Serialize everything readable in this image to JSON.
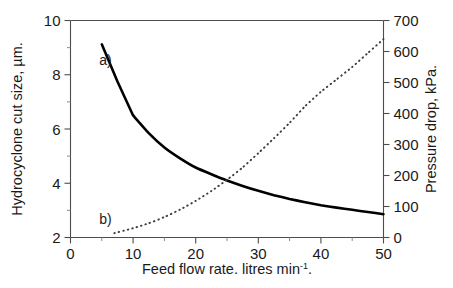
{
  "chart_data": {
    "type": "line",
    "title": "",
    "xlabel_text": "Feed flow rate. litres min",
    "xlabel_sup": "-1",
    "xlabel_tail": ".",
    "ylabel_left": "Hydrocyclone cut size, µm.",
    "ylabel_right": "Pressure drop, kPa.",
    "xlim": [
      0,
      50
    ],
    "ylim_left": [
      2,
      10
    ],
    "ylim_right": [
      0,
      700
    ],
    "grid": false,
    "legend_position": "inline-annotations",
    "x_ticks": [
      "0",
      "10",
      "20",
      "30",
      "40",
      "50"
    ],
    "x_tick_values": [
      0,
      10,
      20,
      30,
      40,
      50
    ],
    "x_minor_step": 5,
    "y_left_ticks": [
      "2",
      "4",
      "6",
      "8",
      "10"
    ],
    "y_left_tick_values": [
      2,
      4,
      6,
      8,
      10
    ],
    "y_left_minor_step": 1,
    "y_right_ticks": [
      "0",
      "100",
      "200",
      "300",
      "400",
      "500",
      "600",
      "700"
    ],
    "y_right_tick_values": [
      0,
      100,
      200,
      300,
      400,
      500,
      600,
      700
    ],
    "series": [
      {
        "name": "a",
        "label": "a)",
        "axis": "left",
        "style": "solid",
        "color": "#000000",
        "x": [
          5.0,
          7.5,
          10.0,
          12.5,
          15.0,
          17.5,
          20.0,
          22.5,
          25.0,
          27.5,
          30.0,
          32.5,
          35.0,
          37.5,
          40.0,
          42.5,
          45.0,
          47.5,
          50.0
        ],
        "y": [
          9.12,
          7.75,
          6.5,
          5.85,
          5.32,
          4.92,
          4.58,
          4.33,
          4.1,
          3.9,
          3.72,
          3.56,
          3.42,
          3.3,
          3.19,
          3.1,
          3.02,
          2.94,
          2.86
        ]
      },
      {
        "name": "b",
        "label": "b)",
        "axis": "right",
        "style": "dotted",
        "color": "#3d3d3d",
        "x": [
          7.0,
          10.0,
          12.5,
          15.0,
          17.5,
          20.0,
          22.5,
          25.0,
          27.5,
          30.0,
          32.5,
          35.0,
          37.5,
          40.0,
          42.5,
          45.0,
          47.5,
          50.0
        ],
        "y": [
          14,
          30,
          46,
          66,
          90,
          118,
          150,
          186,
          226,
          272,
          320,
          370,
          424,
          470,
          510,
          550,
          595,
          640
        ]
      }
    ],
    "annotations": [
      {
        "text": "a)",
        "x": 3.0,
        "y_left": 8.55
      },
      {
        "text": "b)",
        "x": 3.0,
        "y_left": 2.68
      }
    ]
  },
  "figure": {
    "background_color": "#ffffff",
    "axis_color": "#4d4d4d",
    "text_color": "#1a1a1a"
  }
}
